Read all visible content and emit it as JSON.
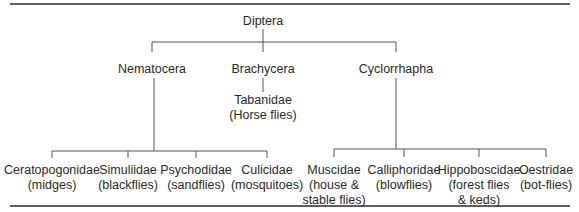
{
  "diagram": {
    "type": "taxonomy-tree",
    "root": {
      "label": "Diptera"
    },
    "suborders": [
      {
        "label": "Nematocera",
        "families": [
          {
            "name": "Ceratopogonidae",
            "common": "(midges)"
          },
          {
            "name": "Simuliidae",
            "common": "(blackflies)"
          },
          {
            "name": "Psychodidae",
            "common": "(sandflies)"
          },
          {
            "name": "Culicidae",
            "common": "(mosquitoes)"
          }
        ]
      },
      {
        "label": "Brachycera",
        "families": [
          {
            "name": "Tabanidae",
            "common": "(Horse flies)"
          }
        ]
      },
      {
        "label": "Cyclorrhapha",
        "families": [
          {
            "name": "Muscidae",
            "common_line1": "(house &",
            "common_line2": "stable flies)"
          },
          {
            "name": "Calliphoridae",
            "common": "(blowflies)"
          },
          {
            "name": "Hippoboscidae",
            "common_line1": "(forest flies",
            "common_line2": "& keds)"
          },
          {
            "name": "Oestridae",
            "common": "(bot-flies)"
          }
        ]
      }
    ],
    "colors": {
      "line": "#4a4a4a",
      "rule": "#2a2a2a",
      "text": "#2a2a2a"
    }
  }
}
